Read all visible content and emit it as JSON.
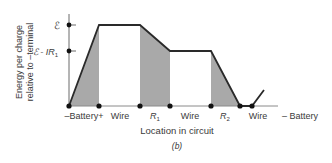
{
  "diagram": {
    "y_axis_label_line1": "Energy per charge",
    "y_axis_label_line2": "relative to –terminal",
    "y_ticks": {
      "emf": "ℰ",
      "emf_minus_ir_base": "ℰ - IR",
      "emf_minus_ir_sub": "1"
    },
    "x_labels": {
      "battery_pos": "–Battery+",
      "wire1": "Wire",
      "r1_base": "R",
      "r1_sub": "1",
      "wire2": "Wire",
      "r2_base": "R",
      "r2_sub": "2",
      "wire3": "Wire",
      "battery_neg": "– Battery"
    },
    "x_axis_title": "Location in circuit",
    "caption": "(b)",
    "colors": {
      "line": "#2a2a2a",
      "shade": "#a9a9a9",
      "axis": "#6a6a6a",
      "dot": "#111111"
    }
  }
}
